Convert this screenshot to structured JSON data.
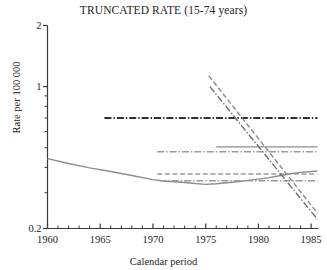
{
  "chart_data": {
    "type": "line",
    "title": "TRUNCATED RATE (15-74 years)",
    "xlabel": "Calendar period",
    "ylabel": "Rate per 100 000",
    "yscale": "log",
    "ylim": [
      0.2,
      2
    ],
    "xlim": [
      1960,
      1985.7
    ],
    "grid": false,
    "legend": "none",
    "x_ticks_major": [
      1960,
      1965,
      1970,
      1975,
      1980,
      1985
    ],
    "x_tick_labels": [
      "1960",
      "1965",
      "1970",
      "1975",
      "1980",
      "1985"
    ],
    "x_ticks_minor": [
      1961,
      1962,
      1963,
      1964,
      1966,
      1967,
      1968,
      1969,
      1971,
      1972,
      1973,
      1974,
      1976,
      1977,
      1978,
      1979,
      1981,
      1982,
      1983,
      1984
    ],
    "y_ticks_major": [
      0.2,
      1,
      2
    ],
    "y_tick_labels": [
      "0.2",
      "1",
      "2"
    ],
    "y_ticks_minor": [
      0.3,
      0.4,
      0.5,
      0.6,
      0.7,
      0.8,
      0.9
    ],
    "series": [
      {
        "name": "observed-rate-curve",
        "style": "solid",
        "color": "#8d8d8d",
        "x": [
          1960,
          1962,
          1964,
          1966,
          1968,
          1970,
          1971,
          1972,
          1973,
          1974,
          1975,
          1976,
          1977,
          1978,
          1979,
          1980,
          1981,
          1982,
          1983,
          1984,
          1985,
          1985.6
        ],
        "values": [
          0.442,
          0.418,
          0.398,
          0.382,
          0.365,
          0.348,
          0.343,
          0.34,
          0.337,
          0.333,
          0.33,
          0.332,
          0.336,
          0.34,
          0.345,
          0.35,
          0.356,
          0.364,
          0.372,
          0.378,
          0.382,
          0.384
        ]
      },
      {
        "name": "reference-level-high",
        "style": "dashdot",
        "color": "#303030",
        "x": [
          1965.4,
          1985.6
        ],
        "values": [
          0.7,
          0.7
        ]
      },
      {
        "name": "reference-level-mid-solid",
        "style": "solid",
        "color": "#8d8d8d",
        "x": [
          1976.0,
          1985.6
        ],
        "values": [
          0.505,
          0.505
        ]
      },
      {
        "name": "reference-level-mid-dashdot",
        "style": "dashdot",
        "color": "#9a9a9a",
        "x": [
          1970.4,
          1985.6
        ],
        "values": [
          0.478,
          0.478
        ]
      },
      {
        "name": "reference-level-low-dashed",
        "style": "dashed",
        "color": "#9a9a9a",
        "x": [
          1970.4,
          1985.6
        ],
        "values": [
          0.371,
          0.371
        ]
      },
      {
        "name": "reference-level-low-dashdot",
        "style": "dashdot",
        "color": "#9a9a9a",
        "x": [
          1970.6,
          1985.6
        ],
        "values": [
          0.344,
          0.344
        ]
      },
      {
        "name": "projection-decline-upper",
        "style": "dashed",
        "color": "#8b8b8b",
        "x": [
          1975.3,
          1985.6
        ],
        "values": [
          1.13,
          0.238
        ]
      },
      {
        "name": "projection-decline-lower",
        "style": "dashdot",
        "color": "#6f6f6f",
        "x": [
          1975.4,
          1985.6
        ],
        "values": [
          1.0,
          0.222
        ]
      }
    ]
  }
}
